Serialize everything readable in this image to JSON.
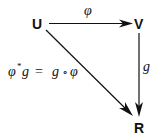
{
  "diagram": {
    "type": "commutative-diagram",
    "nodes": {
      "U": "U",
      "V": "V",
      "R": "R"
    },
    "edges": {
      "top": {
        "from": "U",
        "to": "V",
        "label": "φ"
      },
      "right": {
        "from": "V",
        "to": "R",
        "label": "g"
      },
      "diagonal": {
        "from": "U",
        "to": "R",
        "label": "φ*g = g ∘ φ"
      }
    },
    "equation": {
      "lhs_phi": "φ",
      "lhs_star": "*",
      "lhs_g": "g",
      "equals": "=",
      "rhs_g": "g",
      "compose": "∘",
      "rhs_phi": "φ"
    }
  }
}
